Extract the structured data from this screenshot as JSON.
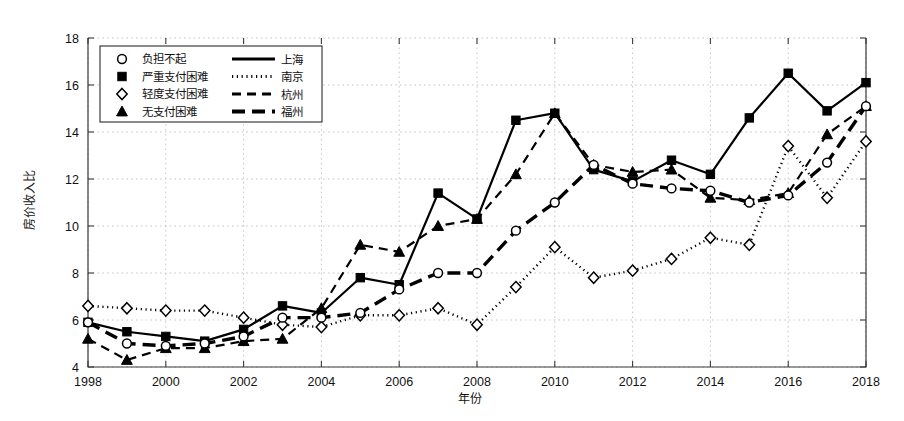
{
  "chart_data": {
    "type": "line",
    "title": "",
    "xlabel": "年份",
    "ylabel": "房价收入比",
    "xlim": [
      1998,
      2018
    ],
    "ylim": [
      4,
      18
    ],
    "ytick_values": [
      4,
      6,
      8,
      10,
      12,
      14,
      16,
      18
    ],
    "ytick_labels": [
      "4",
      "6",
      "8",
      "10",
      "12",
      "14",
      "16",
      "18"
    ],
    "xtick_values": [
      1998,
      2000,
      2002,
      2004,
      2006,
      2008,
      2010,
      2012,
      2014,
      2016,
      2018
    ],
    "xtick_labels": [
      "1998",
      "2000",
      "2002",
      "2004",
      "2006",
      "2008",
      "2010",
      "2012",
      "2014",
      "2016",
      "2018"
    ],
    "grid": true,
    "legend_position": "upper-left",
    "x": [
      1998,
      1999,
      2000,
      2001,
      2002,
      2003,
      2004,
      2005,
      2006,
      2007,
      2008,
      2009,
      2010,
      2011,
      2012,
      2013,
      2014,
      2015,
      2016,
      2017,
      2018
    ],
    "series": [
      {
        "name": "上海",
        "marker": "square",
        "marker_label": "严重支付困难",
        "linestyle": "solid",
        "values": [
          5.9,
          5.5,
          5.3,
          5.1,
          5.6,
          6.6,
          6.3,
          7.8,
          7.5,
          11.4,
          10.3,
          14.5,
          14.8,
          12.4,
          11.9,
          12.8,
          12.2,
          14.6,
          16.5,
          14.9,
          16.1
        ]
      },
      {
        "name": "南京",
        "marker": "diamond",
        "marker_label": "轻度支付困难",
        "linestyle": "dotted",
        "values": [
          6.6,
          6.5,
          6.4,
          6.4,
          6.1,
          5.8,
          5.7,
          6.2,
          6.2,
          6.5,
          5.8,
          7.4,
          9.1,
          7.8,
          8.1,
          8.6,
          9.5,
          9.2,
          13.4,
          11.2,
          13.6
        ]
      },
      {
        "name": "杭州",
        "marker": "triangle",
        "marker_label": "无支付困难",
        "linestyle": "dashed",
        "values": [
          5.2,
          4.3,
          4.8,
          4.8,
          5.1,
          5.2,
          6.5,
          9.2,
          8.9,
          10.0,
          10.3,
          12.2,
          14.8,
          12.6,
          12.3,
          12.4,
          11.2,
          11.1,
          11.4,
          13.9,
          15.1
        ]
      },
      {
        "name": "福州",
        "marker": "circle",
        "marker_label": "负担不起",
        "linestyle": "thick-dash",
        "values": [
          5.9,
          5.0,
          4.9,
          5.0,
          5.3,
          6.1,
          6.1,
          6.3,
          7.3,
          8.0,
          8.0,
          9.8,
          11.0,
          12.6,
          11.8,
          11.6,
          11.5,
          11.0,
          11.3,
          12.7,
          15.1
        ]
      }
    ]
  },
  "legend": {
    "items": [
      {
        "marker_label": "负担不起",
        "marker": "circle",
        "line_label": "上海",
        "linestyle": "solid"
      },
      {
        "marker_label": "严重支付困难",
        "marker": "square",
        "line_label": "南京",
        "linestyle": "dotted"
      },
      {
        "marker_label": "轻度支付困难",
        "marker": "diamond",
        "line_label": "杭州",
        "linestyle": "dashed"
      },
      {
        "marker_label": "无支付困难",
        "marker": "triangle",
        "line_label": "福州",
        "linestyle": "thick-dash"
      }
    ]
  },
  "colors": {
    "ink": "#000000",
    "grid": "#b9b9b9",
    "axis": "#3a3a3a",
    "background": "#ffffff"
  }
}
